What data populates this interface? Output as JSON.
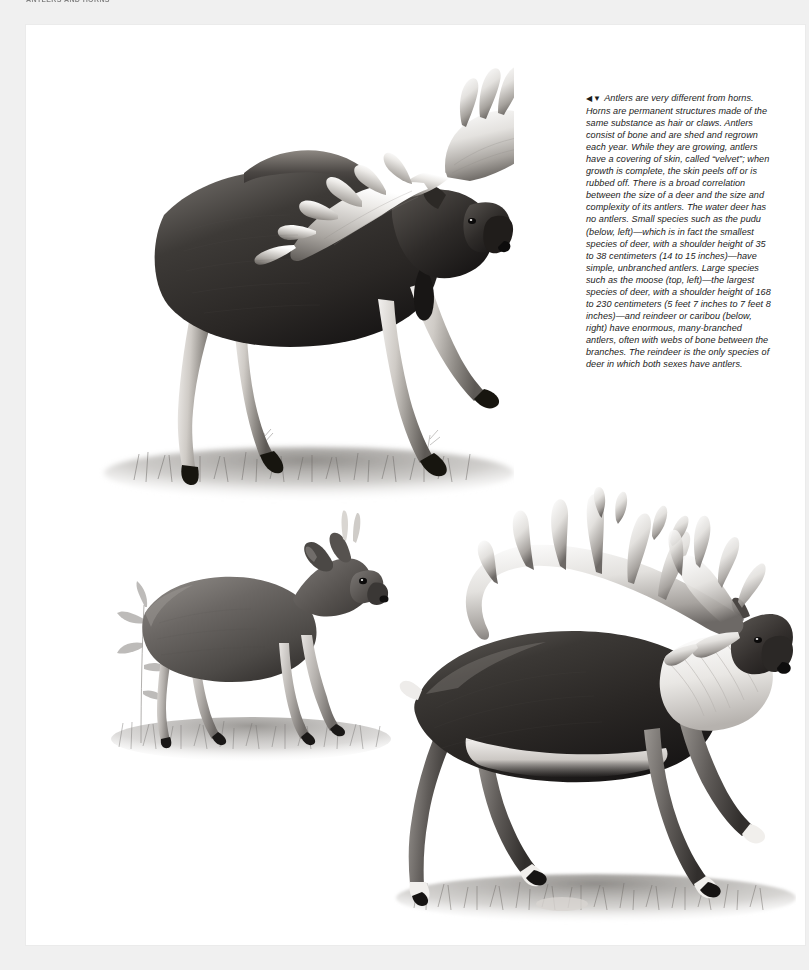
{
  "page": {
    "header": "ANTLERS AND HORNS",
    "background_color": "#f0f0f0",
    "sheet_color": "#ffffff",
    "text_color": "#1b1b1b"
  },
  "caption": {
    "arrows": "◀▼",
    "body": " Antlers are very different from horns. Horns are permanent structures made of the same substance as hair or claws. Antlers consist of bone and are shed and regrown each year. While they are growing, antlers have a covering of skin, called “velvet”; when growth is complete, the skin peels off or is rubbed off. There is a broad correlation between the size of a deer and the size and complexity of its antlers. The water deer has no antlers. Small species such as the pudu (below, left)—which is in fact the smallest species of deer, with a shoulder height of 35 to 38 centimeters (14 to 15 inches)—have simple, unbranched antlers. Large species such as the moose (top, left)—the largest species of deer, with a shoulder height of 168 to 230 centimeters (5 feet 7 inches to 7 feet 8 inches)—and reindeer or caribou (below, right) have enormous, many-branched antlers, often with webs of bone between the branches. The reindeer is the only species of deer in which both sexes have antlers."
  },
  "illustrations": [
    {
      "id": "moose",
      "name": "moose",
      "position": "top, left",
      "description": "Bull moose in full stride with large palmate antlers, heavy dewlap and dark brown-black coat, standing in grass.",
      "shoulder_height": "168 to 230 centimeters (5 feet 7 inches to 7 feet 8 inches)",
      "antler_type": "palmate, many-branched with webs of bone"
    },
    {
      "id": "pudu",
      "name": "pudu",
      "position": "below, left",
      "description": "Small pudu deer standing in grass beside a slender leafy plant, with short simple spike antlers.",
      "shoulder_height": "35 to 38 centimeters (14 to 15 inches)",
      "antler_type": "simple, unbranched"
    },
    {
      "id": "caribou",
      "name": "reindeer or caribou",
      "position": "below, right",
      "description": "Reindeer walking to the right with sweeping many-branched antlers, pale neck mane and dark body.",
      "shoulder_height": "",
      "antler_type": "enormous, many-branched with webs of bone"
    }
  ]
}
